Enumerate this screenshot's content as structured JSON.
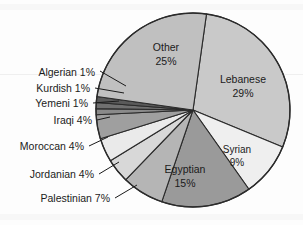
{
  "chart_data": {
    "type": "pie",
    "title": "",
    "subtitle": "",
    "xlabel": "",
    "ylabel": "",
    "legend_position": "none",
    "grid": false,
    "categories": [
      "Lebanese",
      "Syrian",
      "Egyptian",
      "Palestinian",
      "Jordanian",
      "Moroccan",
      "Iraqi",
      "Yemeni",
      "Kurdish",
      "Algerian",
      "Other"
    ],
    "values": [
      29,
      9,
      15,
      7,
      4,
      4,
      4,
      1,
      1,
      1,
      25
    ],
    "unit": "%",
    "total": 100,
    "start_angle_deg": 8,
    "direction": "clockwise",
    "slices": [
      {
        "label": "Lebanese",
        "value": 29,
        "value_text": "29%",
        "label_placement": "inside",
        "color": "#c9c9c9"
      },
      {
        "label": "Syrian",
        "value": 9,
        "value_text": "9%",
        "label_placement": "inside",
        "color": "#efefef"
      },
      {
        "label": "Egyptian",
        "value": 15,
        "value_text": "15%",
        "label_placement": "inside",
        "color": "#9a9a9a"
      },
      {
        "label": "Palestinian",
        "value": 7,
        "value_text": "7%",
        "label_placement": "outside",
        "color": "#b5b5b5"
      },
      {
        "label": "Jordanian",
        "value": 4,
        "value_text": "4%",
        "label_placement": "outside",
        "color": "#d8d8d8"
      },
      {
        "label": "Moroccan",
        "value": 4,
        "value_text": "4%",
        "label_placement": "outside",
        "color": "#eaeaea"
      },
      {
        "label": "Iraqi",
        "value": 4,
        "value_text": "4%",
        "label_placement": "outside",
        "color": "#9f9f9f"
      },
      {
        "label": "Yemeni",
        "value": 1,
        "value_text": "1%",
        "label_placement": "outside",
        "color": "#8a8a8a"
      },
      {
        "label": "Kurdish",
        "value": 1,
        "value_text": "1%",
        "label_placement": "outside",
        "color": "#707070"
      },
      {
        "label": "Algerian",
        "value": 1,
        "value_text": "1%",
        "label_placement": "outside",
        "color": "#5a5a5a"
      },
      {
        "label": "Other",
        "value": 25,
        "value_text": "25%",
        "label_placement": "inside",
        "color": "#c0c0c0"
      }
    ]
  },
  "labels": {
    "lebanese_name": "Lebanese",
    "lebanese_value": "29%",
    "syrian_name": "Syrian",
    "syrian_value": "9%",
    "egyptian_name": "Egyptian",
    "egyptian_value": "15%",
    "other_name": "Other",
    "other_value": "25%",
    "palestinian": "Palestinian 7%",
    "jordanian": "Jordanian 4%",
    "moroccan": "Moroccan 4%",
    "iraqi": "Iraqi 4%",
    "yemeni": "Yemeni 1%",
    "kurdish": "Kurdish 1%",
    "algerian": "Algerian 1%"
  },
  "colors": {
    "outline": "#2b2b2b",
    "text": "#1b1b1b",
    "background": "#fdfdfd"
  }
}
